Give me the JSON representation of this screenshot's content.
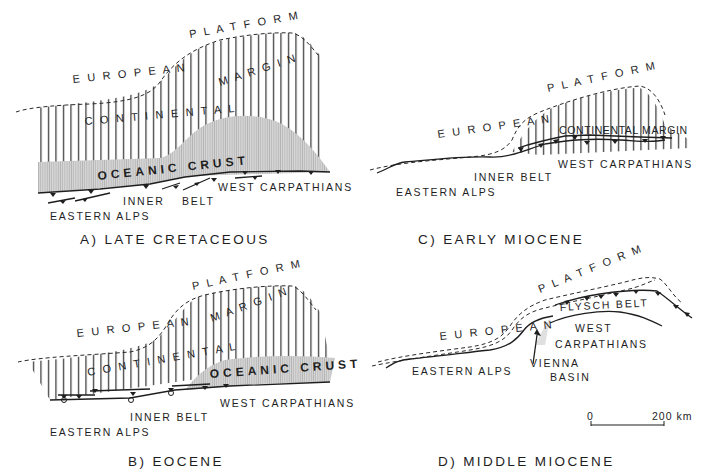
{
  "figure": {
    "panels": [
      {
        "id": "A",
        "title": "A)  LATE  CRETACEOUS",
        "labels": {
          "european_platform_1": "E U R O P E A N",
          "european_platform_2": "P L A T F O R M",
          "continental_1": "C O N T I N E N T A L",
          "margin": "M A R G I N",
          "oceanic_crust": "OCEANIC  CRUST",
          "west_carpathians": "WEST  CARPATHIANS",
          "inner": "INNER",
          "belt": "BELT",
          "eastern_alps": "EASTERN  ALPS"
        }
      },
      {
        "id": "B",
        "title": "B)   EOCENE",
        "labels": {
          "european_platform_1": "E U R O P E A N",
          "european_platform_2": "P L A T F O R M",
          "continental_1": "C O N T I N E N T A L",
          "margin": "M A R G I N",
          "oceanic_crust": "OCEANIC  CRUST",
          "west_carpathians": "WEST  CARPATHIANS",
          "inner_belt": "INNER  BELT",
          "eastern_alps": "EASTERN  ALPS"
        }
      },
      {
        "id": "C",
        "title": "C)   EARLY  MIOCENE",
        "labels": {
          "european_platform_1": "E U R O P E A N",
          "european_platform_2": "P L A T F O R M",
          "continental_margin": "CONTINENTAL MARGIN",
          "west_carpathians": "WEST  CARPATHIANS",
          "inner_belt": "INNER  BELT",
          "eastern_alps": "EASTERN  ALPS"
        }
      },
      {
        "id": "D",
        "title": "D)   MIDDLE  MIOCENE",
        "labels": {
          "european_platform_1": "E U R O P E A N",
          "european_platform_2": "P L A T F O R M",
          "flysch_belt": "FLYSCH  BELT",
          "west": "WEST",
          "carpathians": "CARPATHIANS",
          "vienna": "VIENNA",
          "basin": "BASIN",
          "eastern_alps": "EASTERN  ALPS"
        },
        "scale_bar": {
          "start": "0",
          "end": "200 km"
        }
      }
    ],
    "colors": {
      "ink": "#1e1e1e",
      "oceanic_fill": "#c9c9c9",
      "background": "#ffffff"
    }
  }
}
